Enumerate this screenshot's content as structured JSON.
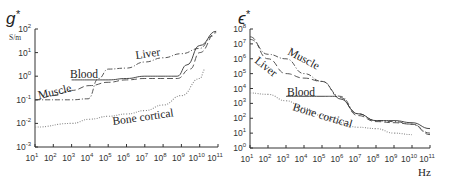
{
  "chart_data": [
    {
      "type": "line",
      "title": "g*",
      "ylabel": "S/m",
      "xlabel": "",
      "x_scale": "log",
      "y_scale": "log",
      "xlim": [
        10,
        100000000000.0
      ],
      "ylim": [
        0.001,
        100
      ],
      "x_ticks": [
        "10^1",
        "10^2",
        "10^3",
        "10^4",
        "10^5",
        "10^6",
        "10^7",
        "10^8",
        "10^9",
        "10^10",
        "10^11"
      ],
      "y_ticks": [
        "10^-3",
        "10^-2",
        "10^-1",
        "10^0",
        "10^1",
        "10^2"
      ],
      "grid": false,
      "legend": "inline labels",
      "series": [
        {
          "name": "Liver",
          "style": "dash-dot",
          "x": [
            10,
            1000,
            8000,
            30000,
            100000.0,
            1000000.0,
            10000000.0,
            100000000.0,
            1000000000.0,
            10000000000.0,
            50000000000.0
          ],
          "y": [
            0.1,
            0.1,
            0.11,
            0.8,
            2.0,
            2.2,
            4.0,
            6.0,
            9.0,
            15,
            50
          ]
        },
        {
          "name": "Blood",
          "style": "solid",
          "x": [
            1000,
            10000.0,
            100000.0,
            1000000.0,
            10000000.0,
            100000000.0,
            600000000.0,
            2000000000.0,
            10000000000.0,
            80000000000.0
          ],
          "y": [
            0.7,
            0.7,
            0.7,
            0.8,
            1.0,
            1.0,
            1.0,
            3.0,
            20,
            80
          ]
        },
        {
          "name": "Muscle",
          "style": "dashed",
          "x": [
            10,
            100,
            1000,
            10000.0,
            100000.0,
            1000000.0,
            10000000.0,
            100000000.0,
            600000000.0,
            3000000000.0,
            10000000000.0,
            80000000000.0
          ],
          "y": [
            0.1,
            0.15,
            0.25,
            0.4,
            0.55,
            0.7,
            0.8,
            0.8,
            0.8,
            2.0,
            10,
            70
          ]
        },
        {
          "name": "Bone cortical",
          "style": "dotted",
          "x": [
            10,
            1000,
            10000.0,
            100000.0,
            1000000.0,
            10000000.0,
            100000000.0,
            1000000000.0,
            10000000000.0,
            20000000000.0
          ],
          "y": [
            0.007,
            0.01,
            0.015,
            0.02,
            0.025,
            0.035,
            0.06,
            0.15,
            0.8,
            2.0
          ]
        }
      ]
    },
    {
      "type": "line",
      "title": "ε*",
      "ylabel": "",
      "xlabel": "Hz",
      "x_scale": "log",
      "y_scale": "log",
      "xlim": [
        10,
        100000000000.0
      ],
      "ylim": [
        1,
        100000000.0
      ],
      "x_ticks": [
        "10^1",
        "10^2",
        "10^3",
        "10^4",
        "10^5",
        "10^6",
        "10^7",
        "10^8",
        "10^9",
        "10^10",
        "10^11"
      ],
      "y_ticks": [
        "10^0",
        "10^1",
        "10^2",
        "10^3",
        "10^4",
        "10^5",
        "10^6",
        "10^7",
        "10^8"
      ],
      "grid": false,
      "legend": "inline labels",
      "series": [
        {
          "name": "Muscle",
          "style": "dash-dot",
          "x": [
            10,
            100,
            1000,
            10000.0,
            100000.0,
            1000000.0,
            10000000.0,
            100000000.0,
            1000000000.0,
            10000000000.0,
            100000000000.0
          ],
          "y": [
            20000000.0,
            2000000.0,
            1000000.0,
            100000.0,
            30000.0,
            3000,
            200,
            70,
            60,
            40,
            10
          ]
        },
        {
          "name": "Liver",
          "style": "dashed",
          "x": [
            10,
            100,
            1000,
            10000.0,
            100000.0,
            1000000.0,
            10000000.0,
            100000000.0,
            1000000000.0,
            10000000000.0,
            100000000000.0
          ],
          "y": [
            30000000.0,
            1000000.0,
            100000.0,
            50000.0,
            30000.0,
            2500,
            150,
            60,
            50,
            40,
            8
          ]
        },
        {
          "name": "Blood",
          "style": "solid",
          "x": [
            1000,
            10000.0,
            100000.0,
            500000.0,
            1000000.0,
            10000000.0,
            100000000.0,
            1000000000.0,
            10000000000.0,
            100000000000.0
          ],
          "y": [
            3000,
            3000,
            3000,
            3000,
            2000,
            200,
            70,
            70,
            50,
            20
          ]
        },
        {
          "name": "Bone cortical",
          "style": "dotted",
          "x": [
            10,
            100,
            1000,
            10000.0,
            100000.0,
            1000000.0,
            10000000.0,
            100000000.0,
            1000000000.0,
            10000000000.0
          ],
          "y": [
            5000,
            4000,
            1500,
            500,
            150,
            50,
            25,
            20,
            10,
            8
          ]
        }
      ]
    }
  ],
  "labels": {
    "left": {
      "title": "g",
      "title_star": "*",
      "unit": "S/m",
      "series_labels": [
        "Liver",
        "Blood",
        "Muscle",
        "Bone cortical"
      ],
      "y_tick_exps": [
        "2",
        "1",
        "0",
        "-1",
        "-2",
        "-3"
      ],
      "x_tick_exps": [
        "1",
        "2",
        "3",
        "4",
        "5",
        "6",
        "7",
        "8",
        "9",
        "10",
        "11"
      ]
    },
    "right": {
      "title": "ϵ",
      "title_star": "*",
      "xlabel": "Hz",
      "series_labels": [
        "Muscle",
        "Liver",
        "Blood",
        "Bone cortical"
      ],
      "y_tick_exps": [
        "8",
        "7",
        "6",
        "5",
        "4",
        "3",
        "2",
        "1",
        "0"
      ],
      "x_tick_exps": [
        "1",
        "2",
        "3",
        "4",
        "5",
        "6",
        "7",
        "8",
        "9",
        "10",
        "11"
      ]
    },
    "tick_base": "10"
  }
}
